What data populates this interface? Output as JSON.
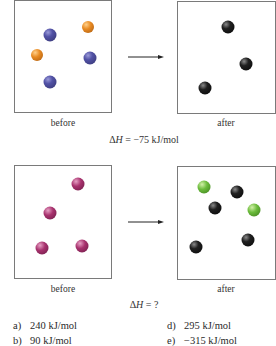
{
  "reaction_1": {
    "before_label": "before",
    "after_label": "after",
    "delta_h_symbol": "ΔH",
    "delta_h_equals": " = −75 kJ/mol",
    "before_particles": [
      {
        "color": "blue"
      },
      {
        "color": "orange"
      },
      {
        "color": "blue"
      },
      {
        "color": "orange"
      },
      {
        "color": "blue"
      }
    ],
    "after_particles": [
      {
        "color": "black"
      },
      {
        "color": "black"
      },
      {
        "color": "black"
      }
    ]
  },
  "reaction_2": {
    "before_label": "before",
    "after_label": "after",
    "delta_h_symbol": "ΔH",
    "delta_h_equals": " = ?",
    "before_particles": [
      {
        "color": "magenta"
      },
      {
        "color": "magenta"
      },
      {
        "color": "magenta"
      },
      {
        "color": "magenta"
      }
    ],
    "after_particles": [
      {
        "color": "green"
      },
      {
        "color": "black"
      },
      {
        "color": "black"
      },
      {
        "color": "green"
      },
      {
        "color": "black"
      },
      {
        "color": "black"
      }
    ]
  },
  "colors": {
    "blue": "#5252a6",
    "orange": "#e88a22",
    "black": "#151515",
    "magenta": "#a8326e",
    "green": "#6cbc3c",
    "box_border": "#7a7a7a"
  },
  "options": [
    {
      "letter": "a)",
      "text": "240 kJ/mol"
    },
    {
      "letter": "d)",
      "text": "295 kJ/mol"
    },
    {
      "letter": "b)",
      "text": "90 kJ/mol"
    },
    {
      "letter": "e)",
      "text": "−315 kJ/mol"
    }
  ]
}
